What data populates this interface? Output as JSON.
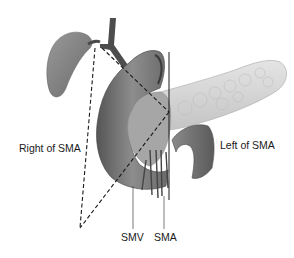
{
  "figure": {
    "labels": {
      "right_of_sma": "Right of SMA",
      "left_of_sma": "Left of SMA",
      "smv": "SMV",
      "sma": "SMA"
    },
    "colors": {
      "organ_dark": "#5e5e5e",
      "organ_mid": "#8a8a8a",
      "pancreas_light": "#d6d6d6",
      "line": "#1a1a1a",
      "background": "#ffffff"
    }
  }
}
